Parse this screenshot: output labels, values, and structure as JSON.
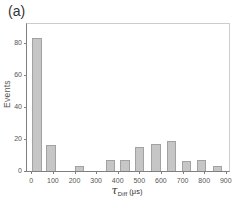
{
  "panel_label": "(a)",
  "colors": {
    "background": "#ffffff",
    "bar_fill": "#c6c6c6",
    "bar_edge": "#a2a2a2",
    "axis_line": "#7f7f7f",
    "frame_line": "#cccccc",
    "tick_text": "#555555",
    "label_text": "#333333"
  },
  "chart_data": {
    "type": "bar",
    "title": "",
    "ylabel": "Events",
    "xlabel_tau": "τ",
    "xlabel_sub": "Diff",
    "xlabel_unit": "(μs)",
    "xlim": [
      -20,
      915
    ],
    "ylim": [
      0,
      92
    ],
    "x_ticks": [
      0,
      100,
      200,
      300,
      400,
      500,
      600,
      700,
      800,
      900
    ],
    "y_ticks": [
      0,
      20,
      40,
      60,
      80
    ],
    "grid": false,
    "legend": null,
    "bar_width_us": 44,
    "bars": [
      {
        "center_us": 27,
        "events": 83
      },
      {
        "center_us": 90,
        "events": 16
      },
      {
        "center_us": 222,
        "events": 3
      },
      {
        "center_us": 366,
        "events": 7
      },
      {
        "center_us": 434,
        "events": 7
      },
      {
        "center_us": 501,
        "events": 15
      },
      {
        "center_us": 577,
        "events": 17
      },
      {
        "center_us": 649,
        "events": 19
      },
      {
        "center_us": 718,
        "events": 6
      },
      {
        "center_us": 787,
        "events": 7
      },
      {
        "center_us": 862,
        "events": 3
      }
    ]
  }
}
